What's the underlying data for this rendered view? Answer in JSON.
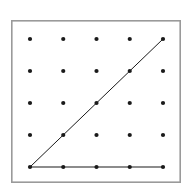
{
  "figure": {
    "canvas": {
      "width": 192,
      "height": 195,
      "background": "#ffffff"
    },
    "frame": {
      "name": "plot-border",
      "x": 11,
      "y": 20,
      "width": 170,
      "height": 163,
      "stroke": "#9a9a9a",
      "stroke_width": 1.6,
      "fill": "#ffffff"
    },
    "grid": {
      "rows": 5,
      "cols": 5,
      "x_start": 30,
      "y_start": 39,
      "x_step": 33.25,
      "y_step": 32,
      "dot_radius": 2.1,
      "dot_color": "#1a1a1a"
    }
  },
  "chart_data": {
    "type": "scatter",
    "title": "",
    "subtitle": "",
    "xlabel": "",
    "ylabel": "",
    "xlim": [
      0,
      4
    ],
    "ylim": [
      0,
      4
    ],
    "grid": false,
    "legend": "none",
    "x_tick_labels": [],
    "y_tick_labels": [],
    "series": [
      {
        "name": "lattice-points",
        "marker": "dot",
        "color": "#1a1a1a",
        "points": [
          [
            0,
            4
          ],
          [
            1,
            4
          ],
          [
            2,
            4
          ],
          [
            3,
            4
          ],
          [
            4,
            4
          ],
          [
            0,
            3
          ],
          [
            1,
            3
          ],
          [
            2,
            3
          ],
          [
            3,
            3
          ],
          [
            4,
            3
          ],
          [
            0,
            2
          ],
          [
            1,
            2
          ],
          [
            2,
            2
          ],
          [
            3,
            2
          ],
          [
            4,
            2
          ],
          [
            0,
            1
          ],
          [
            1,
            1
          ],
          [
            2,
            1
          ],
          [
            3,
            1
          ],
          [
            4,
            1
          ],
          [
            0,
            0
          ],
          [
            1,
            0
          ],
          [
            2,
            0
          ],
          [
            3,
            0
          ],
          [
            4,
            0
          ]
        ]
      }
    ],
    "annotations": [
      {
        "name": "diagonal-line",
        "type": "line",
        "from": [
          0,
          0
        ],
        "to": [
          4,
          4
        ],
        "color": "#1a1a1a",
        "width": 1
      },
      {
        "name": "base-line",
        "type": "line",
        "from": [
          0,
          0
        ],
        "to": [
          4,
          0
        ],
        "color": "#1a1a1a",
        "width": 1.1
      }
    ]
  }
}
